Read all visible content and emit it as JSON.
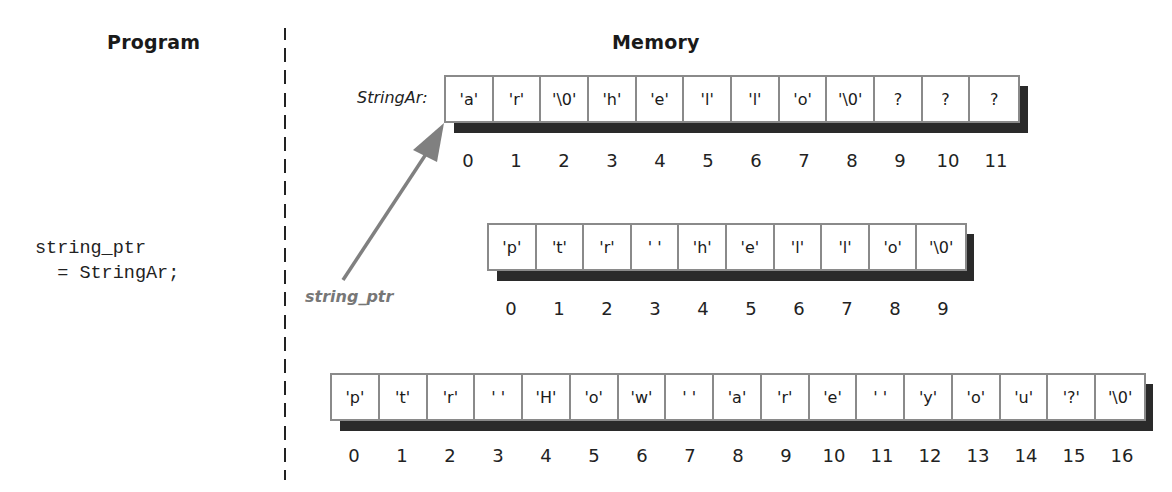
{
  "headings": {
    "program": "Program",
    "memory": "Memory"
  },
  "program": {
    "code_line1": "string_ptr",
    "code_line2": "  = StringAr;"
  },
  "pointer": {
    "label": "string_ptr",
    "color": "#777777",
    "target": "StringAr[0]"
  },
  "arrays": [
    {
      "label": "StringAr:",
      "cells": [
        "'a'",
        "'r'",
        "'\\0'",
        "'h'",
        "'e'",
        "'l'",
        "'l'",
        "'o'",
        "'\\0'",
        "?",
        "?",
        "?"
      ],
      "indices": [
        "0",
        "1",
        "2",
        "3",
        "4",
        "5",
        "6",
        "7",
        "8",
        "9",
        "10",
        "11"
      ]
    },
    {
      "label": "",
      "cells": [
        "'p'",
        "'t'",
        "'r'",
        "' '",
        "'h'",
        "'e'",
        "'l'",
        "'l'",
        "'o'",
        "'\\0'"
      ],
      "indices": [
        "0",
        "1",
        "2",
        "3",
        "4",
        "5",
        "6",
        "7",
        "8",
        "9"
      ]
    },
    {
      "label": "",
      "cells": [
        "'p'",
        "'t'",
        "'r'",
        "' '",
        "'H'",
        "'o'",
        "'w'",
        "' '",
        "'a'",
        "'r'",
        "'e'",
        "' '",
        "'y'",
        "'o'",
        "'u'",
        "'?'",
        "'\\0'"
      ],
      "indices": [
        "0",
        "1",
        "2",
        "3",
        "4",
        "5",
        "6",
        "7",
        "8",
        "9",
        "10",
        "11",
        "12",
        "13",
        "14",
        "15",
        "16"
      ]
    }
  ],
  "colors": {
    "cell_border": "#8a8a8a",
    "shadow": "#2a2a2a",
    "arrow": "#808080"
  }
}
